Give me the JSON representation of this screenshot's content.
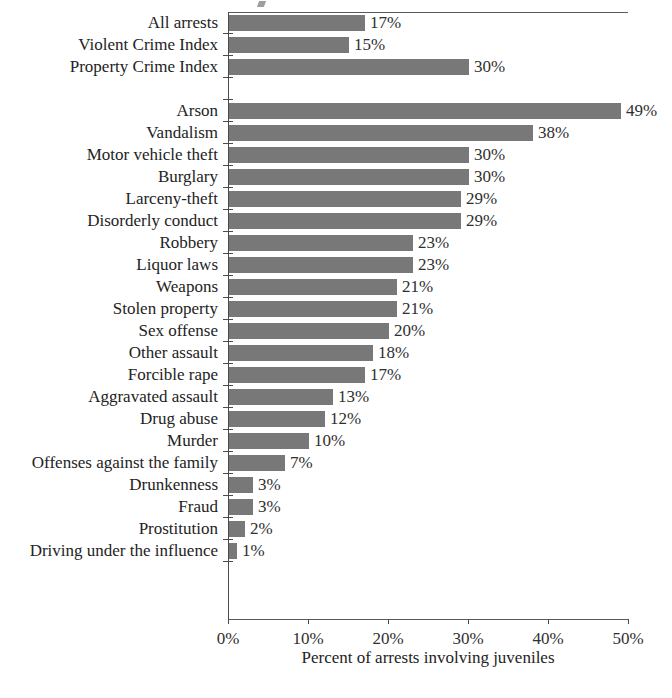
{
  "chart_data": {
    "type": "bar",
    "orientation": "horizontal",
    "title": "",
    "xlabel": "Percent of arrests involving juveniles",
    "ylabel": "",
    "xlim": [
      0,
      50
    ],
    "xticks": [
      "0%",
      "10%",
      "20%",
      "30%",
      "40%",
      "50%"
    ],
    "xtick_values": [
      0,
      10,
      20,
      30,
      40,
      50
    ],
    "grid": false,
    "legend": null,
    "value_label_suffix": "%",
    "categories": [
      "All arrests",
      "Violent Crime Index",
      "Property Crime Index",
      "Arson",
      "Vandalism",
      "Motor vehicle theft",
      "Burglary",
      "Larceny-theft",
      "Disorderly conduct",
      "Robbery",
      "Liquor laws",
      "Weapons",
      "Stolen property",
      "Sex offense",
      "Other assault",
      "Forcible rape",
      "Aggravated assault",
      "Drug abuse",
      "Murder",
      "Offenses against the family",
      "Drunkenness",
      "Fraud",
      "Prostitution",
      "Driving under the influence"
    ],
    "values": [
      17,
      15,
      30,
      49,
      38,
      30,
      30,
      29,
      29,
      23,
      23,
      21,
      21,
      20,
      18,
      17,
      13,
      12,
      10,
      7,
      3,
      3,
      2,
      1
    ],
    "value_labels": [
      "17%",
      "15%",
      "30%",
      "49%",
      "38%",
      "30%",
      "30%",
      "29%",
      "29%",
      "23%",
      "23%",
      "21%",
      "21%",
      "20%",
      "18%",
      "17%",
      "13%",
      "12%",
      "10%",
      "7%",
      "3%",
      "3%",
      "2%",
      "1%"
    ],
    "groups": [
      {
        "name": "summary",
        "categories": [
          "All arrests",
          "Violent Crime Index",
          "Property Crime Index"
        ]
      },
      {
        "name": "offenses",
        "categories": [
          "Arson",
          "Vandalism",
          "Motor vehicle theft",
          "Burglary",
          "Larceny-theft",
          "Disorderly conduct",
          "Robbery",
          "Liquor laws",
          "Weapons",
          "Stolen property",
          "Sex offense",
          "Other assault",
          "Forcible rape",
          "Aggravated assault",
          "Drug abuse",
          "Murder",
          "Offenses against the family",
          "Drunkenness",
          "Fraud",
          "Prostitution",
          "Driving under the influence"
        ]
      }
    ],
    "gap_after_index": 2,
    "bar_color": "#787878"
  }
}
